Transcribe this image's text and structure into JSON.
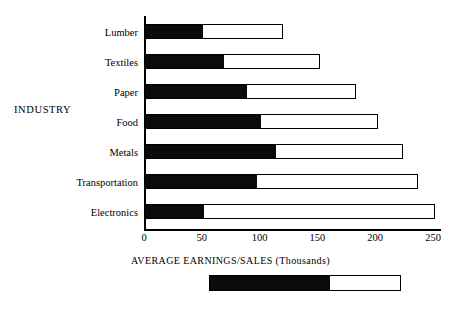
{
  "chart_data": {
    "type": "bar",
    "orientation": "horizontal",
    "stacked": true,
    "title": "",
    "xlabel": "AVERAGE EARNINGS/SALES (Thousands)",
    "ylabel": "INDUSTRY",
    "categories": [
      "Lumber",
      "Textiles",
      "Paper",
      "Food",
      "Metals",
      "Transportation",
      "Electronics"
    ],
    "series": [
      {
        "name": "filled-segment",
        "color": "#0a0a0a",
        "values": [
          50,
          68,
          88,
          100,
          113,
          97,
          51
        ]
      },
      {
        "name": "open-segment",
        "color": "#ffffff",
        "values": [
          70,
          84,
          95,
          102,
          111,
          140,
          201
        ]
      }
    ],
    "totals": [
      120,
      152,
      183,
      202,
      224,
      237,
      252
    ],
    "xticks": [
      0,
      50,
      100,
      150,
      200,
      250
    ],
    "xtick_labels": [
      "0",
      "50",
      "100",
      "150",
      "200",
      "250"
    ],
    "xlim": [
      0,
      260
    ],
    "grid": false,
    "legend": {
      "position": "bottom",
      "filled_fraction": 0.63
    }
  }
}
